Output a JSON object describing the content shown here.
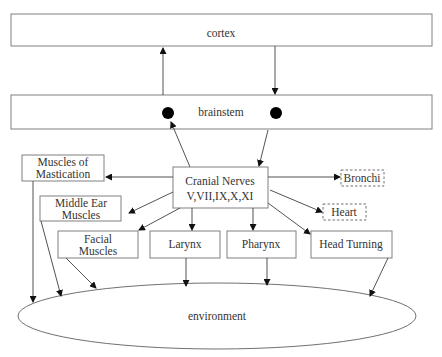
{
  "diagram": {
    "title": "",
    "nodes": {
      "cortex": "cortex",
      "brainstem": "brainstem",
      "cranial_line1": "Cranial Nerves",
      "cranial_line2": "V,VII,IX,X,XI",
      "mastication_line1": "Muscles of",
      "mastication_line2": "Mastication",
      "middle_ear_line1": "Middle Ear",
      "middle_ear_line2": "Muscles",
      "facial_line1": "Facial",
      "facial_line2": "Muscles",
      "larynx": "Larynx",
      "pharynx": "Pharynx",
      "head_turning": "Head Turning",
      "bronchi": "Bronchi",
      "heart": "Heart",
      "environment": "environment"
    },
    "edges": [
      {
        "from": "brainstem",
        "to": "cortex"
      },
      {
        "from": "cortex",
        "to": "brainstem"
      },
      {
        "from": "cranial_nerves",
        "to": "brainstem"
      },
      {
        "from": "brainstem",
        "to": "cranial_nerves"
      },
      {
        "from": "cranial_nerves",
        "to": "muscles_of_mastication"
      },
      {
        "from": "cranial_nerves",
        "to": "middle_ear_muscles"
      },
      {
        "from": "cranial_nerves",
        "to": "facial_muscles"
      },
      {
        "from": "cranial_nerves",
        "to": "larynx"
      },
      {
        "from": "cranial_nerves",
        "to": "pharynx"
      },
      {
        "from": "cranial_nerves",
        "to": "head_turning"
      },
      {
        "from": "cranial_nerves",
        "to": "bronchi"
      },
      {
        "from": "cranial_nerves",
        "to": "heart"
      },
      {
        "from": "muscles_of_mastication",
        "to": "environment"
      },
      {
        "from": "middle_ear_muscles",
        "to": "environment"
      },
      {
        "from": "facial_muscles",
        "to": "environment"
      },
      {
        "from": "larynx",
        "to": "environment"
      },
      {
        "from": "pharynx",
        "to": "environment"
      },
      {
        "from": "head_turning",
        "to": "environment"
      }
    ]
  }
}
